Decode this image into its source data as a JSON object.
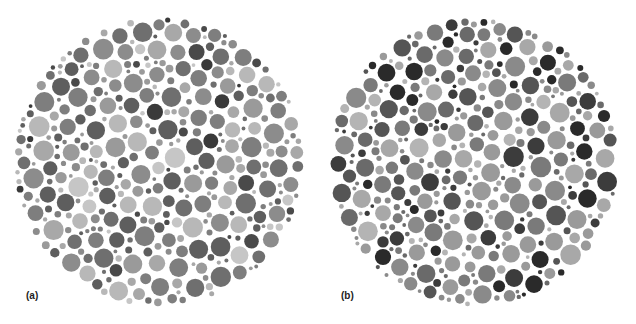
{
  "figure": {
    "background": "#ffffff",
    "plates": [
      {
        "id": "a",
        "label": "(a)",
        "label_pos": [
          26,
          290
        ],
        "center": [
          159,
          162
        ],
        "radius": 145,
        "seed": 17,
        "palette": [
          "#5e5e5e",
          "#6f6f6f",
          "#7e7e7e",
          "#8c8c8c",
          "#9a9a9a",
          "#a8a8a8",
          "#b8b8b8",
          "#c6c6c6",
          "#4a4a4a",
          "#3a3a3a"
        ],
        "weights": [
          14,
          14,
          14,
          14,
          12,
          11,
          8,
          6,
          5,
          2
        ]
      },
      {
        "id": "b",
        "label": "(b)",
        "label_pos": [
          341,
          290
        ],
        "center": [
          474,
          162
        ],
        "radius": 145,
        "seed": 53,
        "palette": [
          "#2a2a2a",
          "#3c3c3c",
          "#555555",
          "#6a6a6a",
          "#7a7a7a",
          "#8a8a8a",
          "#9a9a9a",
          "#a8a8a8",
          "#b4b4b4"
        ],
        "weights": [
          9,
          9,
          8,
          12,
          14,
          15,
          14,
          12,
          7
        ]
      }
    ]
  }
}
